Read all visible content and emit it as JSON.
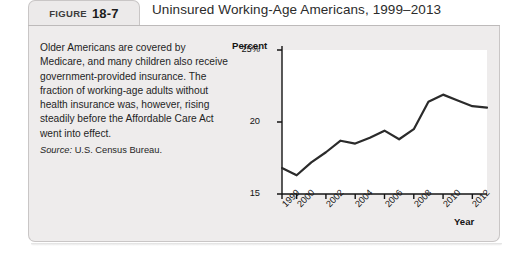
{
  "figure": {
    "label_word": "FIGURE",
    "number": "18-7",
    "title": "Uninsured Working-Age Americans, 1999–2013"
  },
  "caption": {
    "body": "Older Americans are covered by Medicare, and many children also receive government-provided insurance. The fraction of working-age adults without health insurance was, however, rising steadily before the Affordable Care Act went into effect.",
    "source_label": "Source:",
    "source_text": "U.S. Census Bureau."
  },
  "colors": {
    "line": "#2b2b2b",
    "panel_background": "#eeecec",
    "plot_background": "#ffffff",
    "axis": "#141414",
    "tab_background": "#eceaea"
  },
  "chart_data": {
    "type": "line",
    "title": "Uninsured Working-Age Americans, 1999–2013",
    "xlabel": "Year",
    "ylabel": "Percent",
    "ylim": [
      15,
      25
    ],
    "yticks": [
      15,
      20,
      25
    ],
    "ytick_labels": [
      "15",
      "20",
      "25%"
    ],
    "xlim": [
      1999,
      2013
    ],
    "xticks": [
      1999,
      2000,
      2002,
      2004,
      2006,
      2008,
      2010,
      2012
    ],
    "xtick_labels": [
      "1999",
      "2000",
      "2002",
      "2004",
      "2006",
      "2008",
      "2010",
      "2012"
    ],
    "grid": false,
    "legend": false,
    "x": [
      1999,
      2000,
      2001,
      2002,
      2003,
      2004,
      2005,
      2006,
      2007,
      2008,
      2009,
      2010,
      2011,
      2012,
      2013
    ],
    "values": [
      16.8,
      16.3,
      17.2,
      17.9,
      18.7,
      18.5,
      18.9,
      19.4,
      18.8,
      19.5,
      21.4,
      21.9,
      21.5,
      21.1,
      21.0
    ],
    "series": [
      {
        "name": "Percent of working-age Americans uninsured",
        "values": [
          16.8,
          16.3,
          17.2,
          17.9,
          18.7,
          18.5,
          18.9,
          19.4,
          18.8,
          19.5,
          21.4,
          21.9,
          21.5,
          21.1,
          21.0
        ]
      }
    ]
  }
}
